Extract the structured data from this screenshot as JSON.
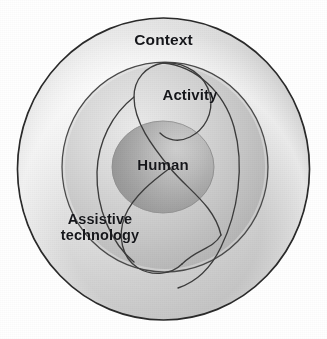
{
  "figure": {
    "kind": "concentric-circles-venn-diagram",
    "background_color": "#ffffff",
    "width": 327,
    "height": 339,
    "labels": {
      "context": "Context",
      "activity": "Activity",
      "human": "Human",
      "assistive_technology": "Assistive\ntechnology"
    },
    "rings": [
      {
        "name": "context",
        "label": "Context",
        "level": 1,
        "cx": 163.5,
        "cy": 169,
        "rx": 146,
        "ry": 151,
        "fill_light": "#f2f2f2",
        "fill_mid": "#d2d2d2",
        "fill_dark": "#b4b4b4",
        "stroke": "#2a2a2a"
      },
      {
        "name": "assistive-technology",
        "label": "Assistive technology",
        "level": 2,
        "cx": 165,
        "cy": 167,
        "rx": 103,
        "ry": 105,
        "fill_light": "#e6e6e6",
        "fill_mid": "#c2c2c2",
        "fill_dark": "#a6a6a6",
        "stroke": "#4a4a4a"
      },
      {
        "name": "human",
        "label": "Human",
        "level": 3,
        "cx": 163,
        "cy": 167,
        "rx": 51,
        "ry": 46,
        "fill_light": "#c8c8c8",
        "fill_mid": "#a8a8a8",
        "fill_dark": "#8a8a8a",
        "stroke": "#8f8f8f"
      }
    ],
    "activity_shape": {
      "name": "activity-lens",
      "label": "Activity",
      "stroke": "#3c3c3c",
      "fill": "none",
      "description": "S-shaped double-loop curve sweeping from upper-right through the human core to the lower-left"
    },
    "colors": {
      "ink": "#15161a",
      "outline": "#2a2a2a",
      "paper": "#ffffff"
    }
  }
}
